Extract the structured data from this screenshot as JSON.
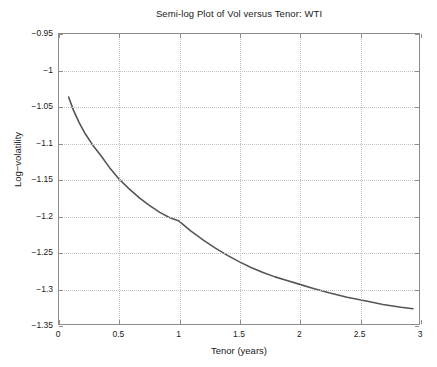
{
  "chart_data": {
    "type": "line",
    "title": "Semi-log Plot of Vol versus Tenor: WTI",
    "xlabel": "Tenor (years)",
    "ylabel": "Log−volatility",
    "xlim": [
      0,
      3
    ],
    "ylim": [
      -1.35,
      -0.95
    ],
    "grid": true,
    "legend": null,
    "xticks": [
      0,
      0.5,
      1,
      1.5,
      2,
      2.5,
      3
    ],
    "xtick_labels": [
      "0",
      "0.5",
      "1",
      "1.5",
      "2",
      "2.5",
      "3"
    ],
    "yticks": [
      -0.95,
      -1,
      -1.05,
      -1.1,
      -1.15,
      -1.2,
      -1.25,
      -1.3,
      -1.35
    ],
    "ytick_labels": [
      "−0.95",
      "−1",
      "−1.05",
      "−1.1",
      "−1.15",
      "−1.2",
      "−1.25",
      "−1.3",
      "−1.35"
    ],
    "line_color": "#555555",
    "grid_color": "#c2c2c2",
    "axis_color": "#8d8d8d",
    "background": "#ffffff",
    "series": [
      {
        "name": "WTI log-volatility",
        "x": [
          0.08,
          0.12,
          0.17,
          0.22,
          0.28,
          0.35,
          0.42,
          0.5,
          0.58,
          0.67,
          0.75,
          0.84,
          0.92,
          1.0,
          1.1,
          1.2,
          1.3,
          1.4,
          1.5,
          1.6,
          1.7,
          1.8,
          1.9,
          2.0,
          2.12,
          2.25,
          2.4,
          2.55,
          2.7,
          2.85,
          2.95
        ],
        "y": [
          -1.037,
          -1.055,
          -1.073,
          -1.088,
          -1.103,
          -1.118,
          -1.134,
          -1.15,
          -1.163,
          -1.176,
          -1.186,
          -1.196,
          -1.203,
          -1.208,
          -1.222,
          -1.234,
          -1.245,
          -1.255,
          -1.264,
          -1.272,
          -1.279,
          -1.285,
          -1.29,
          -1.295,
          -1.301,
          -1.307,
          -1.313,
          -1.318,
          -1.323,
          -1.327,
          -1.329
        ]
      }
    ]
  }
}
